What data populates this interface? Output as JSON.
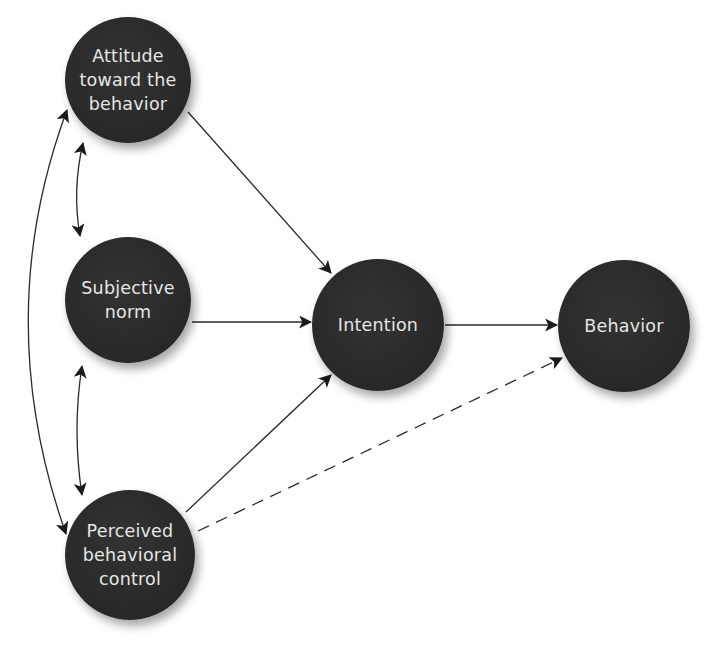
{
  "diagram": {
    "type": "flowchart",
    "title": "",
    "colors": {
      "node_fill": "#2b2b2b",
      "node_text": "#e6e6e6",
      "edge": "#222222",
      "background": "#ffffff"
    },
    "nodes": [
      {
        "id": "attitude",
        "label": "Attitude\ntoward the\nbehavior",
        "shape": "circle",
        "cx": 128,
        "cy": 80,
        "r": 63
      },
      {
        "id": "subjective_norm",
        "label": "Subjective\nnorm",
        "shape": "circle",
        "cx": 128,
        "cy": 300,
        "r": 63
      },
      {
        "id": "perceived_control",
        "label": "Perceived\nbehavioral\ncontrol",
        "shape": "circle",
        "cx": 130,
        "cy": 555,
        "r": 65
      },
      {
        "id": "intention",
        "label": "Intention",
        "shape": "circle",
        "cx": 378,
        "cy": 325,
        "r": 66
      },
      {
        "id": "behavior",
        "label": "Behavior",
        "shape": "circle",
        "cx": 624,
        "cy": 330,
        "r": 66
      }
    ],
    "edges": [
      {
        "from": "attitude",
        "to": "intention",
        "style": "solid",
        "direction": "forward"
      },
      {
        "from": "subjective_norm",
        "to": "intention",
        "style": "solid",
        "direction": "forward"
      },
      {
        "from": "perceived_control",
        "to": "intention",
        "style": "solid",
        "direction": "forward"
      },
      {
        "from": "intention",
        "to": "behavior",
        "style": "solid",
        "direction": "forward"
      },
      {
        "from": "perceived_control",
        "to": "behavior",
        "style": "dashed",
        "direction": "forward"
      },
      {
        "from": "attitude",
        "to": "subjective_norm",
        "style": "solid",
        "direction": "both",
        "curved": true
      },
      {
        "from": "subjective_norm",
        "to": "perceived_control",
        "style": "solid",
        "direction": "both",
        "curved": true
      },
      {
        "from": "attitude",
        "to": "perceived_control",
        "style": "solid",
        "direction": "both",
        "curved": true
      }
    ]
  }
}
